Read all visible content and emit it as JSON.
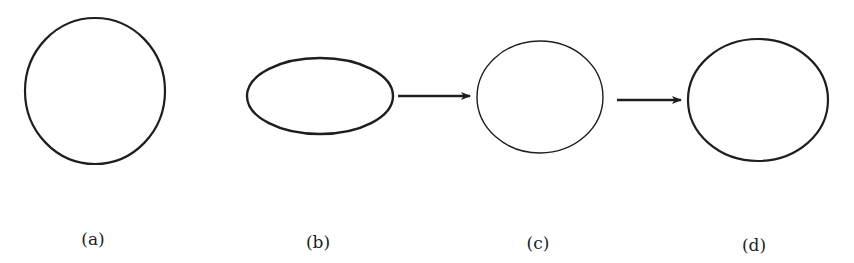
{
  "figure": {
    "panels": [
      {
        "id": "a",
        "label": "(a)",
        "shape": "circle",
        "cx": 95,
        "cy": 91,
        "rx": 70,
        "ry": 73,
        "stroke_width": 2.2,
        "label_x": 93,
        "label_y": 245
      },
      {
        "id": "b",
        "label": "(b)",
        "shape": "horizontal-ellipse",
        "cx": 320,
        "cy": 96,
        "rx": 73,
        "ry": 38,
        "stroke_width": 2.4,
        "label_x": 318,
        "label_y": 248
      },
      {
        "id": "c",
        "label": "(c)",
        "shape": "near-circle",
        "cx": 540,
        "cy": 97,
        "rx": 63,
        "ry": 56,
        "stroke_width": 1.4,
        "label_x": 538,
        "label_y": 249
      },
      {
        "id": "d",
        "label": "(d)",
        "shape": "wide-ellipse",
        "cx": 758,
        "cy": 100,
        "rx": 70,
        "ry": 61,
        "stroke_width": 2.2,
        "label_x": 754,
        "label_y": 251
      }
    ],
    "arrows": [
      {
        "from": "b",
        "to": "c",
        "x1": 398,
        "y1": 96,
        "x2": 470,
        "y2": 96
      },
      {
        "from": "c",
        "to": "d",
        "x1": 617,
        "y1": 100,
        "x2": 681,
        "y2": 100
      }
    ],
    "colors": {
      "stroke": "#1e1e1e",
      "text": "#222222",
      "background": "#ffffff"
    }
  }
}
